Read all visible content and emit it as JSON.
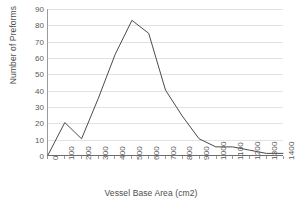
{
  "chart_data": {
    "type": "line",
    "title": "",
    "xlabel": "Vessel Base Area (cm2)",
    "ylabel": "Number of Preforms",
    "x": [
      0,
      100,
      200,
      300,
      400,
      500,
      600,
      700,
      800,
      900,
      1000,
      1100,
      1200,
      1300,
      1400
    ],
    "values": [
      0,
      20,
      10,
      35,
      62,
      83,
      75,
      40,
      24,
      10,
      5,
      5,
      3,
      1,
      1
    ],
    "categories": [
      "0",
      "100",
      "200",
      "300",
      "400",
      "500",
      "600",
      "700",
      "800",
      "900",
      "1000",
      "1100",
      "1200",
      "1300",
      "1400"
    ],
    "xlim": [
      0,
      1400
    ],
    "ylim": [
      0,
      90
    ],
    "x_ticks": [
      "0",
      "100",
      "200",
      "300",
      "400",
      "500",
      "600",
      "700",
      "800",
      "900",
      "1000",
      "1100",
      "1200",
      "1300",
      "1400"
    ],
    "y_ticks": [
      "0",
      "10",
      "20",
      "30",
      "40",
      "50",
      "60",
      "70",
      "80",
      "90"
    ],
    "y_tick_values": [
      0,
      10,
      20,
      30,
      40,
      50,
      60,
      70,
      80,
      90
    ],
    "grid": "horizontal",
    "legend": "none",
    "series_color": "#4a4a4a",
    "grid_color": "#e2e2e2",
    "axis_color": "#6b6b6b",
    "text_color": "#595959",
    "background": "#ffffff"
  }
}
